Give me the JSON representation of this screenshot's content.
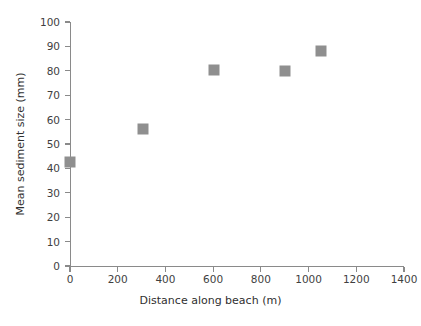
{
  "chart_data": {
    "type": "scatter",
    "title": "",
    "xlabel": "Distance along beach (m)",
    "ylabel": "Mean sediment size (mm)",
    "xlim": [
      0,
      1400
    ],
    "ylim": [
      0,
      100
    ],
    "xticks": [
      0,
      200,
      400,
      600,
      800,
      1000,
      1200,
      1400
    ],
    "yticks": [
      0,
      10,
      20,
      30,
      40,
      50,
      60,
      70,
      80,
      90,
      100
    ],
    "xtick_labels": [
      "0",
      "200",
      "400",
      "600",
      "800",
      "1000",
      "1200",
      "1400"
    ],
    "ytick_labels": [
      "0",
      "10",
      "20",
      "30",
      "40",
      "50",
      "60",
      "70",
      "80",
      "90",
      "100"
    ],
    "grid": false,
    "legend": null,
    "marker": {
      "shape": "square",
      "color": "#8f8f8f",
      "size_px": 11
    },
    "series": [
      {
        "name": "Mean sediment size",
        "points": [
          {
            "x": 0,
            "y": 42.5
          },
          {
            "x": 305,
            "y": 56
          },
          {
            "x": 605,
            "y": 80.5
          },
          {
            "x": 900,
            "y": 80
          },
          {
            "x": 1050,
            "y": 88
          }
        ]
      }
    ]
  },
  "colors": {
    "axis": "#8a8a8a",
    "marker": "#8f8f8f",
    "text": "#3f3f3f",
    "background": "#ffffff"
  }
}
